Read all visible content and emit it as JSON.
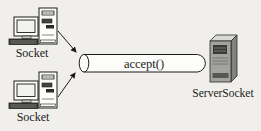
{
  "diagram": {
    "name": "socket-accept-connection-diagram",
    "labels": {
      "client_top": "Socket",
      "client_bottom": "Socket",
      "pipe": "accept()",
      "server": "ServerSocket"
    },
    "icons": {
      "client_top": "desktop-computer-icon",
      "client_bottom": "desktop-computer-icon",
      "server": "server-tower-icon",
      "connector": "arrow-icon"
    },
    "colors": {
      "background": "#f0efec",
      "line": "#1c1c1a",
      "pipe_fill": "#fcfcfa",
      "screen_fill": "#f2f2f0",
      "keyboard_dark": "#3f3f3d",
      "tower_dark": "#3a3a38",
      "server_front": "#a2a2a0",
      "server_top": "#d8d8d6",
      "server_side": "#828280",
      "server_dark": "#3a3a38",
      "server_band": "#565654"
    }
  }
}
